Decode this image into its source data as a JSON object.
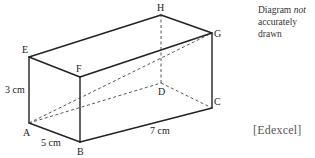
{
  "diagram": {
    "type": "cuboid",
    "vertices": [
      "A",
      "B",
      "C",
      "D",
      "E",
      "F",
      "G",
      "H"
    ],
    "solid_edges": [
      [
        "E",
        "F"
      ],
      [
        "E",
        "H"
      ],
      [
        "H",
        "G"
      ],
      [
        "F",
        "G"
      ],
      [
        "E",
        "A"
      ],
      [
        "F",
        "B"
      ],
      [
        "G",
        "C"
      ],
      [
        "A",
        "B"
      ],
      [
        "B",
        "C"
      ]
    ],
    "hidden_edges": [
      [
        "A",
        "D"
      ],
      [
        "D",
        "C"
      ],
      [
        "D",
        "H"
      ],
      [
        "A",
        "G"
      ]
    ],
    "dimensions": {
      "height": "3 cm",
      "width": "5 cm",
      "length": "7 cm"
    },
    "labels": {
      "A": "A",
      "B": "B",
      "C": "C",
      "D": "D",
      "E": "E",
      "F": "F",
      "G": "G",
      "H": "H"
    }
  },
  "note": {
    "line1_prefix": "Diagram ",
    "line1_emph": "not",
    "line2": "accurately drawn"
  },
  "source": "[Edexcel]"
}
